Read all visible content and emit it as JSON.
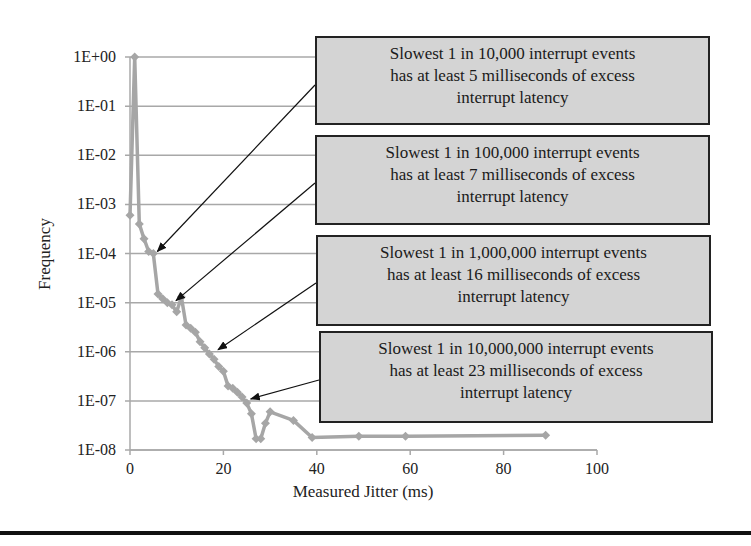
{
  "chart_data": {
    "type": "line",
    "title": "",
    "xlabel": "Measured Jitter (ms)",
    "ylabel": "Frequency",
    "yscale": "log",
    "xlim": [
      0,
      100
    ],
    "ylim": [
      1e-08,
      1
    ],
    "grid": "horizontal",
    "legend": "none",
    "x_ticks": [
      "0",
      "20",
      "40",
      "60",
      "80",
      "100"
    ],
    "y_ticks": [
      "1E+00",
      "1E-01",
      "1E-02",
      "1E-03",
      "1E-04",
      "1E-05",
      "1E-06",
      "1E-07",
      "1E-08"
    ],
    "series": [
      {
        "name": "Frequency",
        "color": "#a6a6a6",
        "points": [
          [
            0,
            0.0006
          ],
          [
            1,
            1.0
          ],
          [
            2,
            0.0004
          ],
          [
            3,
            0.0002
          ],
          [
            4,
            0.00011
          ],
          [
            5,
            0.0001
          ],
          [
            6,
            1.5e-05
          ],
          [
            7,
            1.2e-05
          ],
          [
            8,
            1e-05
          ],
          [
            9,
            9e-06
          ],
          [
            10,
            6.5e-06
          ],
          [
            11,
            1.3e-05
          ],
          [
            12,
            3.5e-06
          ],
          [
            13,
            3e-06
          ],
          [
            14,
            2.5e-06
          ],
          [
            15,
            1.6e-06
          ],
          [
            16,
            1.2e-06
          ],
          [
            17,
            9e-07
          ],
          [
            18,
            7e-07
          ],
          [
            19,
            5e-07
          ],
          [
            20,
            4e-07
          ],
          [
            21,
            2e-07
          ],
          [
            22,
            1.8e-07
          ],
          [
            23,
            1.5e-07
          ],
          [
            24,
            1.2e-07
          ],
          [
            25,
            9e-08
          ],
          [
            26,
            5.5e-08
          ],
          [
            27,
            1.7e-08
          ],
          [
            28,
            1.7e-08
          ],
          [
            29,
            3.5e-08
          ],
          [
            30,
            6e-08
          ],
          [
            35,
            4e-08
          ],
          [
            39,
            1.8e-08
          ],
          [
            49,
            1.9e-08
          ],
          [
            59,
            1.9e-08
          ],
          [
            89,
            2e-08
          ]
        ]
      }
    ],
    "annotations": [
      {
        "text_lines": [
          "Slowest 1 in 10,000 interrupt events",
          "has at least 5 milliseconds of excess",
          "interrupt latency"
        ],
        "target": [
          5,
          0.0001
        ]
      },
      {
        "text_lines": [
          "Slowest 1 in 100,000 interrupt events",
          "has at least 7 milliseconds of excess",
          "interrupt latency"
        ],
        "target": [
          9,
          1e-05
        ]
      },
      {
        "text_lines": [
          "Slowest 1 in 1,000,000 interrupt events",
          "has at least 16 milliseconds of excess",
          "interrupt latency"
        ],
        "target": [
          18,
          1e-06
        ]
      },
      {
        "text_lines": [
          "Slowest 1 in 10,000,000 interrupt events",
          "has at least 23 milliseconds of excess",
          "interrupt latency"
        ],
        "target": [
          25,
          1e-07
        ]
      }
    ]
  }
}
